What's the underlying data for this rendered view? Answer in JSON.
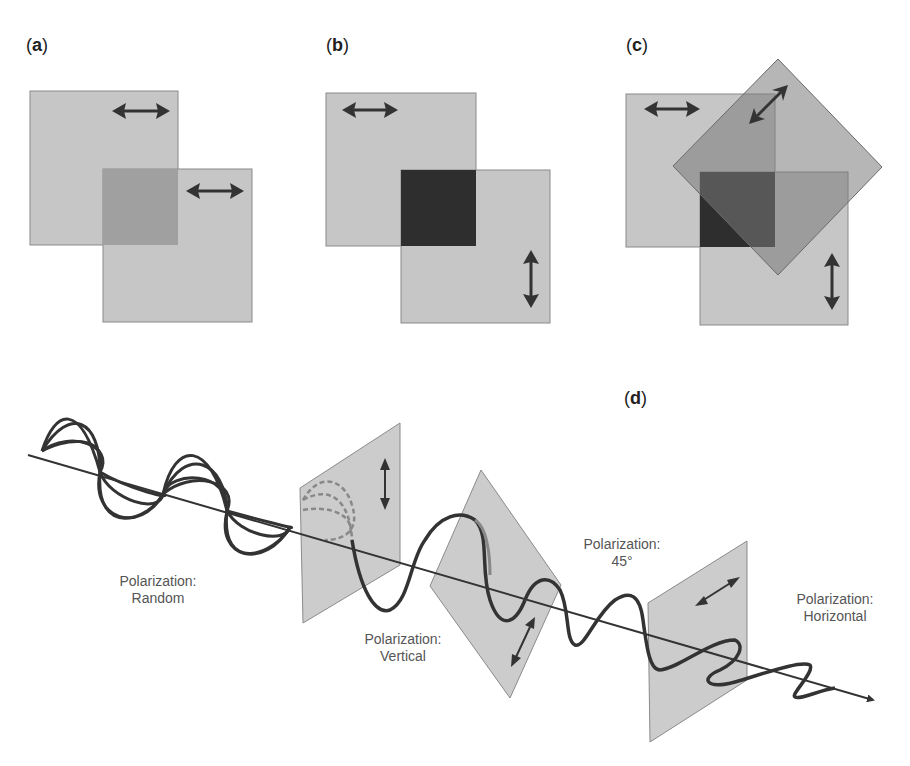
{
  "colors": {
    "filter": "#c6c6c6",
    "filter_border": "#8a8a8a",
    "overlap_parallel": "#a0a0a0",
    "overlap_crossed": "#2e2e2e",
    "diamond_overlap": "#8c8c8c",
    "wave": "#333333",
    "axis": "#333333",
    "arrow": "#333333"
  },
  "panels": {
    "a": {
      "open": "(",
      "letter": "a",
      "close": ")"
    },
    "b": {
      "open": "(",
      "letter": "b",
      "close": ")"
    },
    "c": {
      "open": "(",
      "letter": "c",
      "close": ")"
    },
    "d": {
      "open": "(",
      "letter": "d",
      "close": ")"
    }
  },
  "captions": {
    "random": {
      "line1": "Polarization:",
      "line2": "Random"
    },
    "vertical": {
      "line1": "Polarization:",
      "line2": "Vertical"
    },
    "deg45": {
      "line1": "Polarization:",
      "line2": "45°"
    },
    "horizontal": {
      "line1": "Polarization:",
      "line2": "Horizontal"
    }
  }
}
